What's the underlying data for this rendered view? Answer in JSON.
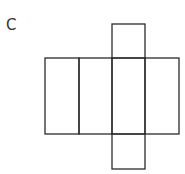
{
  "diagram": {
    "label": "C",
    "faces": [
      {
        "name": "face-1",
        "row": "middle",
        "column": 1
      },
      {
        "name": "face-2",
        "row": "middle",
        "column": 2
      },
      {
        "name": "face-3",
        "row": "middle",
        "column": 3
      },
      {
        "name": "face-4",
        "row": "middle",
        "column": 4
      },
      {
        "name": "top-flap",
        "row": "top",
        "column": 3
      },
      {
        "name": "bottom-flap",
        "row": "bottom",
        "column": 3
      }
    ],
    "stroke_color": "#2b2b2b"
  }
}
